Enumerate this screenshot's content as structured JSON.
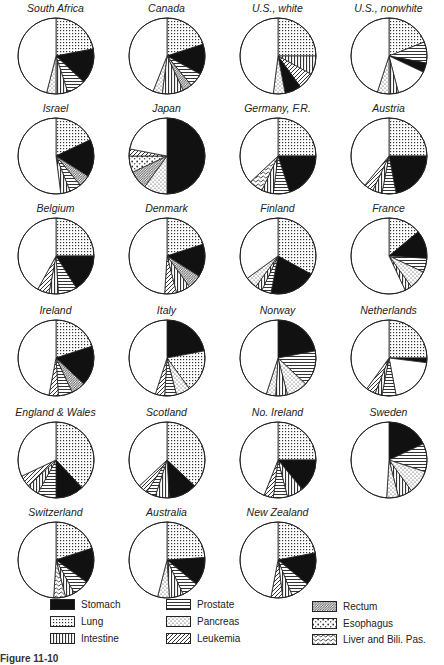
{
  "figure": {
    "caption_fragment": "Figure 11-10"
  },
  "legend": {
    "items": [
      {
        "key": "stomach",
        "label": "Stomach",
        "pattern": "solid-black"
      },
      {
        "key": "lung",
        "label": "Lung",
        "pattern": "fine-grid"
      },
      {
        "key": "intestine",
        "label": "Intestine",
        "pattern": "vertical-lines"
      },
      {
        "key": "prostate",
        "label": "Prostate",
        "pattern": "horizontal-lines"
      },
      {
        "key": "pancreas",
        "label": "Pancreas",
        "pattern": "dots"
      },
      {
        "key": "leukemia",
        "label": "Leukemia",
        "pattern": "diagonal-lines"
      },
      {
        "key": "rectum",
        "label": "Rectum",
        "pattern": "dense-diagonal"
      },
      {
        "key": "esophagus",
        "label": "Esophagus",
        "pattern": "coarse-dots"
      },
      {
        "key": "liver",
        "label": "Liver and Bili. Pas.",
        "pattern": "wavy"
      },
      {
        "key": "other",
        "label": "Other",
        "pattern": "white"
      }
    ]
  },
  "chart_data": {
    "type": "pie",
    "note": "Segment shares estimated visually from small multiples; segments run clockwise from 12 o'clock; white remainder = other sites",
    "legend_position": "bottom",
    "series_keys": [
      "stomach",
      "lung",
      "intestine",
      "prostate",
      "pancreas",
      "leukemia",
      "rectum",
      "esophagus",
      "liver",
      "other"
    ],
    "pies": [
      {
        "name": "South Africa",
        "segments": [
          [
            "lung",
            22
          ],
          [
            "stomach",
            15
          ],
          [
            "prostate",
            8
          ],
          [
            "intestine",
            5
          ],
          [
            "pancreas",
            4
          ],
          [
            "other",
            46
          ]
        ]
      },
      {
        "name": "Canada",
        "segments": [
          [
            "lung",
            20
          ],
          [
            "stomach",
            13
          ],
          [
            "prostate",
            6
          ],
          [
            "rectum",
            4
          ],
          [
            "intestine",
            9
          ],
          [
            "pancreas",
            4
          ],
          [
            "other",
            44
          ]
        ]
      },
      {
        "name": "U.S., white",
        "segments": [
          [
            "lung",
            25
          ],
          [
            "intestine",
            8
          ],
          [
            "leukemia",
            7
          ],
          [
            "stomach",
            7
          ],
          [
            "pancreas",
            5
          ],
          [
            "other",
            48
          ]
        ]
      },
      {
        "name": "U.S., nonwhite",
        "segments": [
          [
            "lung",
            19
          ],
          [
            "prostate",
            9
          ],
          [
            "stomach",
            4
          ],
          [
            "other",
            14
          ],
          [
            "intestine",
            4
          ],
          [
            "pancreas",
            5
          ],
          [
            "other",
            45
          ]
        ]
      },
      {
        "name": "Israel",
        "segments": [
          [
            "lung",
            18
          ],
          [
            "stomach",
            16
          ],
          [
            "rectum",
            5
          ],
          [
            "prostate",
            5
          ],
          [
            "intestine",
            4
          ],
          [
            "other",
            52
          ]
        ]
      },
      {
        "name": "Japan",
        "segments": [
          [
            "stomach",
            50
          ],
          [
            "pancreas",
            10
          ],
          [
            "dense-diagonal",
            8
          ],
          [
            "esophagus",
            7
          ],
          [
            "leukemia",
            3
          ],
          [
            "other",
            22
          ]
        ]
      },
      {
        "name": "Germany, F.R.",
        "segments": [
          [
            "lung",
            25
          ],
          [
            "stomach",
            20
          ],
          [
            "prostate",
            7
          ],
          [
            "intestine",
            5
          ],
          [
            "liver",
            6
          ],
          [
            "other",
            37
          ]
        ]
      },
      {
        "name": "Austria",
        "segments": [
          [
            "lung",
            25
          ],
          [
            "stomach",
            22
          ],
          [
            "prostate",
            6
          ],
          [
            "intestine",
            4
          ],
          [
            "leukemia",
            4
          ],
          [
            "other",
            39
          ]
        ]
      },
      {
        "name": "Belgium",
        "segments": [
          [
            "lung",
            25
          ],
          [
            "stomach",
            16
          ],
          [
            "prostate",
            8
          ],
          [
            "intestine",
            4
          ],
          [
            "leukemia",
            5
          ],
          [
            "other",
            42
          ]
        ]
      },
      {
        "name": "Denmark",
        "segments": [
          [
            "lung",
            20
          ],
          [
            "stomach",
            14
          ],
          [
            "rectum",
            6
          ],
          [
            "intestine",
            6
          ],
          [
            "leukemia",
            5
          ],
          [
            "other",
            49
          ]
        ]
      },
      {
        "name": "Finland",
        "segments": [
          [
            "lung",
            33
          ],
          [
            "stomach",
            20
          ],
          [
            "prostate",
            4
          ],
          [
            "intestine",
            3
          ],
          [
            "pancreas",
            5
          ],
          [
            "other",
            35
          ]
        ]
      },
      {
        "name": "France",
        "segments": [
          [
            "lung",
            14
          ],
          [
            "stomach",
            12
          ],
          [
            "prostate",
            6
          ],
          [
            "pancreas",
            8
          ],
          [
            "intestine",
            3
          ],
          [
            "other",
            57
          ]
        ]
      },
      {
        "name": "Ireland",
        "segments": [
          [
            "lung",
            20
          ],
          [
            "stomach",
            17
          ],
          [
            "rectum",
            6
          ],
          [
            "prostate",
            6
          ],
          [
            "leukemia",
            4
          ],
          [
            "other",
            47
          ]
        ]
      },
      {
        "name": "Italy",
        "segments": [
          [
            "stomach",
            22
          ],
          [
            "lung",
            18
          ],
          [
            "pancreas",
            6
          ],
          [
            "prostate",
            5
          ],
          [
            "leukemia",
            4
          ],
          [
            "other",
            45
          ]
        ]
      },
      {
        "name": "Norway",
        "segments": [
          [
            "stomach",
            22
          ],
          [
            "prostate",
            15
          ],
          [
            "pancreas",
            9
          ],
          [
            "intestine",
            5
          ],
          [
            "pancreas",
            4
          ],
          [
            "other",
            45
          ]
        ]
      },
      {
        "name": "Netherlands",
        "segments": [
          [
            "lung",
            25
          ],
          [
            "stomach",
            2
          ],
          [
            "other",
            20
          ],
          [
            "prostate",
            6
          ],
          [
            "intestine",
            3
          ],
          [
            "leukemia",
            4
          ],
          [
            "other",
            40
          ]
        ]
      },
      {
        "name": "England & Wales",
        "segments": [
          [
            "lung",
            38
          ],
          [
            "stomach",
            12
          ],
          [
            "prostate",
            8
          ],
          [
            "intestine",
            5
          ],
          [
            "leukemia",
            5
          ],
          [
            "other",
            32
          ]
        ]
      },
      {
        "name": "Scotland",
        "segments": [
          [
            "lung",
            37
          ],
          [
            "stomach",
            12
          ],
          [
            "intestine",
            6
          ],
          [
            "prostate",
            4
          ],
          [
            "leukemia",
            4
          ],
          [
            "other",
            37
          ]
        ]
      },
      {
        "name": "No. Ireland",
        "segments": [
          [
            "lung",
            25
          ],
          [
            "stomach",
            14
          ],
          [
            "intestine",
            7
          ],
          [
            "prostate",
            6
          ],
          [
            "leukemia",
            4
          ],
          [
            "other",
            44
          ]
        ]
      },
      {
        "name": "Sweden",
        "segments": [
          [
            "stomach",
            18
          ],
          [
            "prostate",
            12
          ],
          [
            "pancreas",
            10
          ],
          [
            "intestine",
            6
          ],
          [
            "pancreas",
            5
          ],
          [
            "other",
            49
          ]
        ]
      },
      {
        "name": "Switzerland",
        "segments": [
          [
            "lung",
            20
          ],
          [
            "stomach",
            15
          ],
          [
            "prostate",
            7
          ],
          [
            "intestine",
            4
          ],
          [
            "liver",
            5
          ],
          [
            "other",
            49
          ]
        ]
      },
      {
        "name": "Australia",
        "segments": [
          [
            "lung",
            24
          ],
          [
            "stomach",
            12
          ],
          [
            "prostate",
            7
          ],
          [
            "intestine",
            6
          ],
          [
            "pancreas",
            5
          ],
          [
            "other",
            46
          ]
        ]
      },
      {
        "name": "New Zealand",
        "segments": [
          [
            "lung",
            22
          ],
          [
            "stomach",
            14
          ],
          [
            "prostate",
            8
          ],
          [
            "intestine",
            4
          ],
          [
            "leukemia",
            5
          ],
          [
            "other",
            47
          ]
        ]
      }
    ]
  }
}
